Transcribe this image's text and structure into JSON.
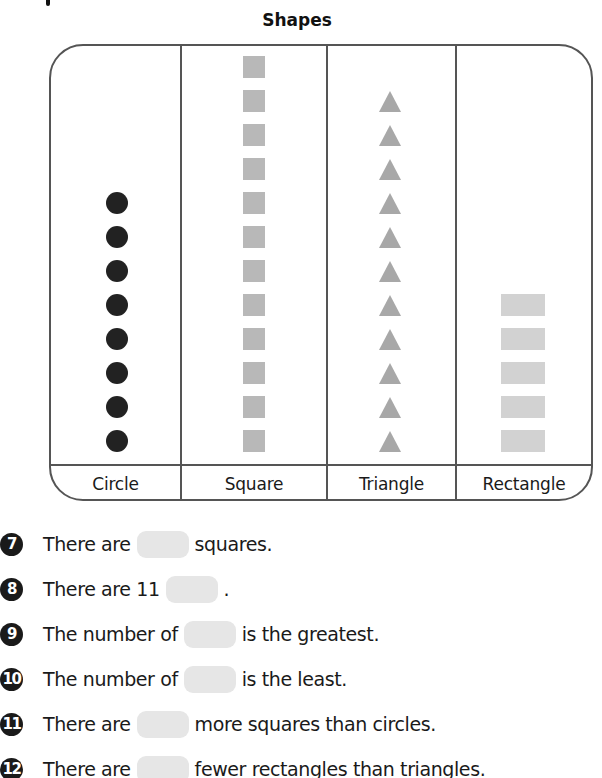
{
  "page": {
    "title": "Shapes",
    "columns": [
      {
        "label": "Circle",
        "count": 8,
        "shape": "circle"
      },
      {
        "label": "Square",
        "count": 12,
        "shape": "square"
      },
      {
        "label": "Triangle",
        "count": 11,
        "shape": "triangle"
      },
      {
        "label": "Rectangle",
        "count": 5,
        "shape": "rectangle"
      }
    ]
  },
  "questions": [
    {
      "number": "7",
      "before": "There are",
      "after": "squares."
    },
    {
      "number": "8",
      "before": "There are 11",
      "after": "."
    },
    {
      "number": "9",
      "before": "The number of",
      "after": "is the greatest."
    },
    {
      "number": "10",
      "before": "The number of",
      "after": "is the least."
    },
    {
      "number": "11",
      "before": "There are",
      "after": "more squares than circles."
    },
    {
      "number": "12",
      "before": "There are",
      "after": "fewer rectangles than triangles."
    }
  ],
  "colors": {
    "circle": "#222222",
    "square": "#b8b8b8",
    "triangle": "#a8a8a8",
    "rectangle": "#d2d2d2",
    "answer_box": "#e6e6e6",
    "border": "#555555"
  },
  "chart_data": {
    "type": "pictograph",
    "title": "Shapes",
    "categories": [
      "Circle",
      "Square",
      "Triangle",
      "Rectangle"
    ],
    "values": [
      8,
      12,
      11,
      5
    ],
    "xlabel": "",
    "ylabel": "",
    "ylim": [
      0,
      12
    ],
    "grid": false,
    "legend": "none"
  }
}
